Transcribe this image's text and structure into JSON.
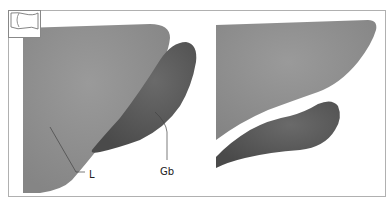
{
  "figure": {
    "type": "anatomical-diagram",
    "panels": [
      {
        "id": "left",
        "inset_icon": "organ-outline-icon",
        "labels": [
          {
            "text": "L",
            "refers_to": "liver"
          },
          {
            "text": "Gb",
            "refers_to": "gallbladder"
          }
        ]
      },
      {
        "id": "right",
        "labels": []
      }
    ],
    "colors": {
      "liver": "#8f8f8f",
      "gallbladder": "#555555",
      "frame": "#aaaaaa",
      "background": "#ffffff"
    }
  }
}
